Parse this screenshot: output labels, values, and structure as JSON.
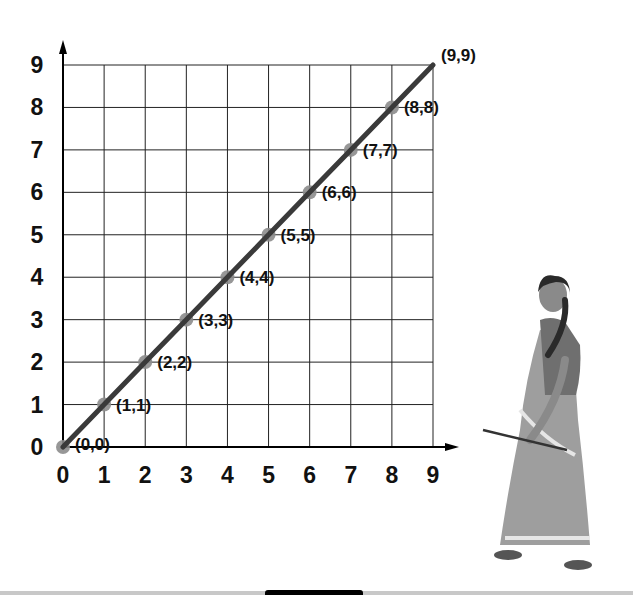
{
  "chart_data": {
    "type": "line",
    "title": "",
    "xlabel": "",
    "ylabel": "",
    "xlim": [
      0,
      9
    ],
    "ylim": [
      0,
      9
    ],
    "grid": true,
    "x_ticks": [
      "0",
      "1",
      "2",
      "3",
      "4",
      "5",
      "6",
      "7",
      "8",
      "9"
    ],
    "y_ticks": [
      "0",
      "1",
      "2",
      "3",
      "4",
      "5",
      "6",
      "7",
      "8",
      "9"
    ],
    "series": [
      {
        "name": "y = x",
        "x": [
          0,
          1,
          2,
          3,
          4,
          5,
          6,
          7,
          8,
          9
        ],
        "y": [
          0,
          1,
          2,
          3,
          4,
          5,
          6,
          7,
          8,
          9
        ]
      }
    ],
    "point_labels": [
      "(0,0)",
      "(1,1)",
      "(2,2)",
      "(3,3)",
      "(4,4)",
      "(5,5)",
      "(6,6)",
      "(7,7)",
      "(8,8)",
      "(9,9)"
    ],
    "colors": {
      "line": "#3a3a3a",
      "points": "#8c8c8c",
      "grid": "#222222"
    }
  },
  "illustration": {
    "description": "woman-with-stick"
  }
}
